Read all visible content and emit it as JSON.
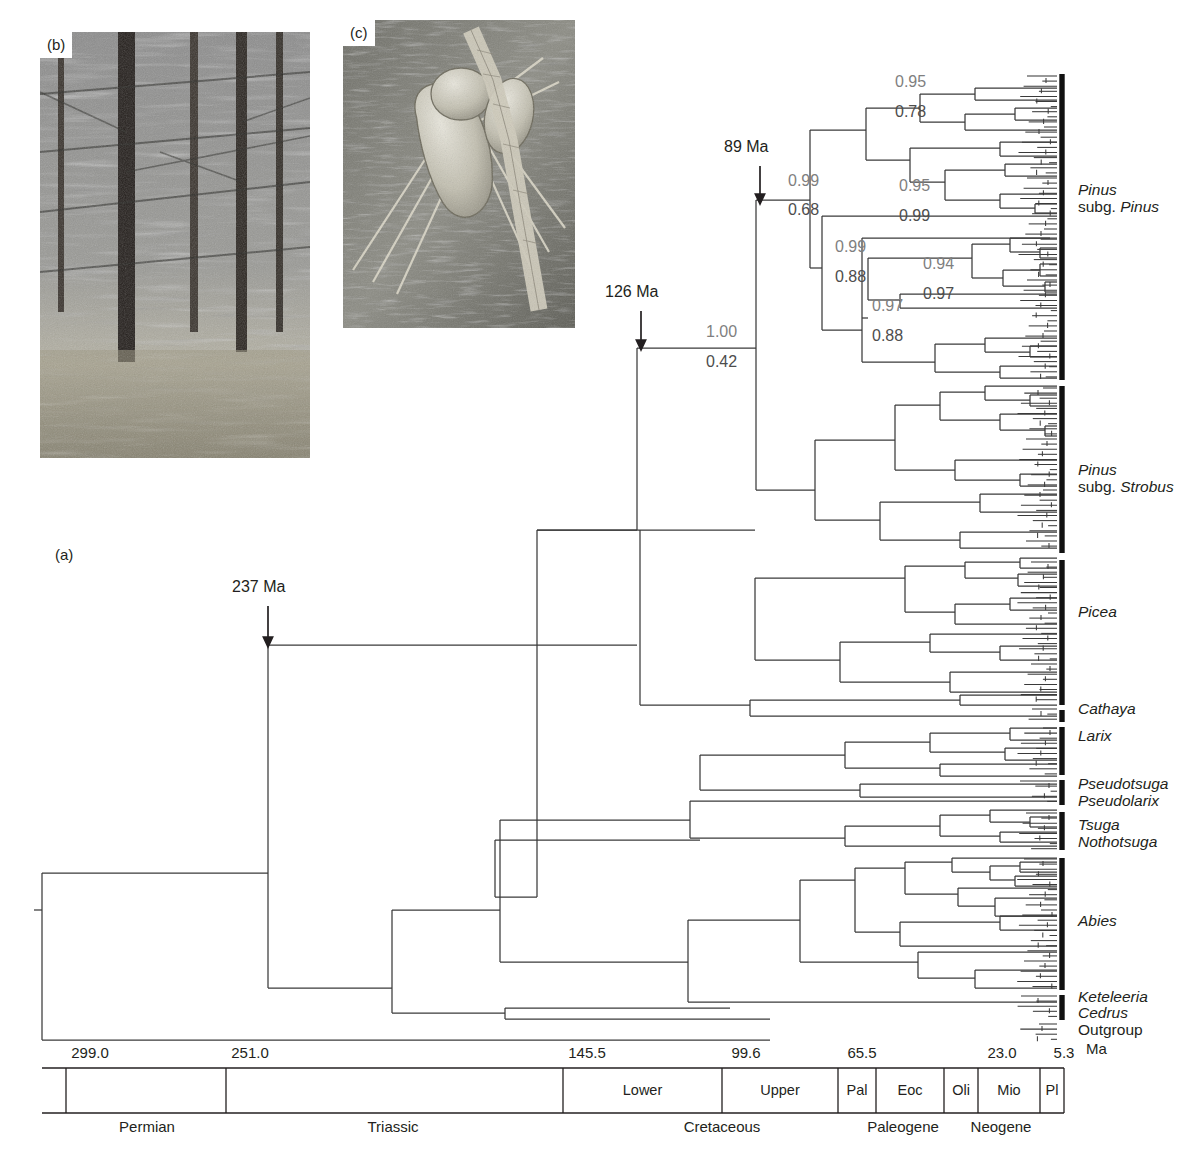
{
  "figure": {
    "panel_a_label": "(a)",
    "panel_b_label": "(b)",
    "panel_c_label": "(c)",
    "type": "phylogenetic-tree-chronogram"
  },
  "callouts": [
    {
      "name": "divergence-237",
      "text": "237 Ma",
      "x": 268,
      "y": 590
    },
    {
      "name": "divergence-126",
      "text": "126 Ma",
      "x": 641,
      "y": 295
    },
    {
      "name": "divergence-89",
      "text": "89 Ma",
      "x": 760,
      "y": 150
    }
  ],
  "support_values": [
    {
      "id": "n-root-pinus",
      "top": "1.00",
      "bottom": "0.42",
      "x": 706,
      "y_top": 334,
      "y_bottom": 364
    },
    {
      "id": "n-subg-pinus",
      "top": "0.99",
      "bottom": "0.68",
      "x": 788,
      "y_top": 183,
      "y_bottom": 212
    },
    {
      "id": "n-pinus-a",
      "top": "0.95",
      "bottom": "0.78",
      "x": 895,
      "y_top": 84,
      "y_bottom": 114
    },
    {
      "id": "n-pinus-b",
      "top": "0.95",
      "bottom": "0.99",
      "x": 899,
      "y_top": 188,
      "y_bottom": 218
    },
    {
      "id": "n-pinus-c",
      "top": "0.99",
      "bottom": "0.88",
      "x": 835,
      "y_top": 249,
      "y_bottom": 279
    },
    {
      "id": "n-pinus-d",
      "top": "0.94",
      "bottom": "0.97",
      "x": 923,
      "y_top": 266,
      "y_bottom": 296
    },
    {
      "id": "n-pinus-e",
      "top": "0.97",
      "bottom": "0.88",
      "x": 872,
      "y_top": 308,
      "y_bottom": 338
    }
  ],
  "clades": [
    {
      "name": "pinus-subg-pinus",
      "line1": "Pinus",
      "line2": "subg. Pinus",
      "line2_roman_prefix": "subg. ",
      "bar_top": 74,
      "bar_bottom": 380,
      "label_y": 190
    },
    {
      "name": "pinus-subg-strobus",
      "line1": "Pinus",
      "line2": "subg. Strobus",
      "line2_roman_prefix": "subg. ",
      "bar_top": 386,
      "bar_bottom": 553,
      "label_y": 470
    },
    {
      "name": "picea",
      "line1": "Picea",
      "line2": "",
      "bar_top": 560,
      "bar_bottom": 705,
      "label_y": 612
    },
    {
      "name": "cathaya",
      "line1": "Cathaya",
      "line2": "",
      "bar_top": 710,
      "bar_bottom": 722,
      "label_y": 709
    },
    {
      "name": "larix",
      "line1": "Larix",
      "line2": "",
      "bar_top": 727,
      "bar_bottom": 775,
      "label_y": 736
    },
    {
      "name": "pseudotsuga",
      "line1": "Pseudotsuga",
      "line2": "",
      "bar_top": 780,
      "bar_bottom": 805,
      "label_y": 784
    },
    {
      "name": "pseudolarix",
      "line1": "Pseudolarix",
      "line2": "",
      "bar_top": 0,
      "bar_bottom": 0,
      "label_y": 801
    },
    {
      "name": "tsuga",
      "line1": "Tsuga",
      "line2": "",
      "bar_top": 812,
      "bar_bottom": 850,
      "label_y": 825
    },
    {
      "name": "nothotsuga",
      "line1": "Nothotsuga",
      "line2": "",
      "bar_top": 0,
      "bar_bottom": 0,
      "label_y": 842
    },
    {
      "name": "abies",
      "line1": "Abies",
      "line2": "",
      "bar_top": 858,
      "bar_bottom": 990,
      "label_y": 921
    },
    {
      "name": "keteleeria",
      "line1": "Keteleeria",
      "line2": "",
      "bar_top": 995,
      "bar_bottom": 1020,
      "label_y": 997
    },
    {
      "name": "cedrus",
      "line1": "Cedrus",
      "line2": "",
      "bar_top": 0,
      "bar_bottom": 0,
      "label_y": 1013
    },
    {
      "name": "outgroup",
      "line1": "Outgroup",
      "line2": "",
      "italic": false,
      "bar_top": 0,
      "bar_bottom": 0,
      "label_y": 1030
    }
  ],
  "chart_data": {
    "type": "timescale-axis",
    "unit_label": "Ma",
    "axis_x_left": 42,
    "axis_x_right": 1057,
    "ticks": [
      {
        "label": "299.0",
        "value": 299.0,
        "x": 66
      },
      {
        "label": "251.0",
        "value": 251.0,
        "x": 226
      },
      {
        "label": "145.5",
        "value": 145.5,
        "x": 563
      },
      {
        "label": "99.6",
        "value": 99.6,
        "x": 722
      },
      {
        "label": "65.5",
        "value": 65.5,
        "x": 838
      },
      {
        "label": "23.0",
        "value": 23.0,
        "x": 978
      },
      {
        "label": "5.3",
        "value": 5.3,
        "x": 1040
      }
    ],
    "epochs": [
      {
        "label": "Lower",
        "x_start": 563,
        "x_end": 722
      },
      {
        "label": "Upper",
        "x_start": 722,
        "x_end": 838
      },
      {
        "label": "Pal",
        "x_start": 838,
        "x_end": 876
      },
      {
        "label": "Eoc",
        "x_start": 876,
        "x_end": 944
      },
      {
        "label": "Oli",
        "x_start": 944,
        "x_end": 978
      },
      {
        "label": "Mio",
        "x_start": 978,
        "x_end": 1040
      },
      {
        "label": "Pl",
        "x_start": 1040,
        "x_end": 1064
      }
    ],
    "periods": [
      {
        "label": "Permian",
        "x_start": 66,
        "x_end": 226,
        "label_x": 147
      },
      {
        "label": "Triassic",
        "x_start": 226,
        "x_end": 563,
        "label_x": 393
      },
      {
        "label": "Cretaceous",
        "x_start": 563,
        "x_end": 838,
        "label_x": 722
      },
      {
        "label": "Paleogene",
        "x_start": 838,
        "x_end": 978,
        "label_x": 903
      },
      {
        "label": "Neogene",
        "x_start": 978,
        "x_end": 1064,
        "label_x": 1001
      }
    ],
    "band_top": 1068,
    "band_bottom": 1113,
    "period_label_y": 1118
  },
  "colors": {
    "tree_line": "#3a3a3a",
    "support_top": "#7f7f7f",
    "support_bottom": "#4d4d4d",
    "bracket": "#111111",
    "text": "#231f20",
    "background": "#ffffff"
  }
}
